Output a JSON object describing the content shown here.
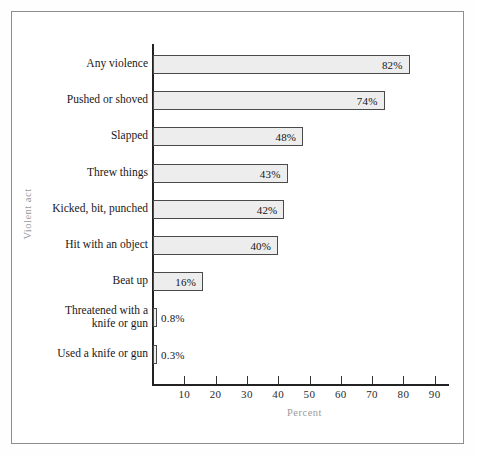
{
  "figure": {
    "background": "#ffffff",
    "frame_color": "#8e8e8e",
    "axis_color": "#222222",
    "bar_fill": "#ededed",
    "bar_edge": "#4a4a4a",
    "axis_title_color": "#9a9a9a"
  },
  "chart_data": {
    "type": "bar",
    "orientation": "horizontal",
    "title": "",
    "xlabel": "Percent",
    "ylabel": "Violent act",
    "xlim": [
      0,
      95
    ],
    "xticks": [
      10,
      20,
      30,
      40,
      50,
      60,
      70,
      80,
      90
    ],
    "xticklabels": [
      "10",
      "20",
      "30",
      "40",
      "50",
      "60",
      "70",
      "80",
      "90"
    ],
    "grid": false,
    "legend": null,
    "categories": [
      "Any violence",
      "Pushed or shoved",
      "Slapped",
      "Threw things",
      "Kicked, bit, punched",
      "Hit with an object",
      "Beat up",
      "Threatened with a\nknife or gun",
      "Used a knife or gun"
    ],
    "values": [
      82,
      74,
      48,
      43,
      42,
      40,
      16,
      0.8,
      0.3
    ],
    "value_labels": [
      "82%",
      "74%",
      "48%",
      "43%",
      "42%",
      "40%",
      "16%",
      "0.8%",
      "0.3%"
    ],
    "label_placement": [
      "inside",
      "inside",
      "inside",
      "inside",
      "inside",
      "inside",
      "inside",
      "outside",
      "outside"
    ]
  }
}
